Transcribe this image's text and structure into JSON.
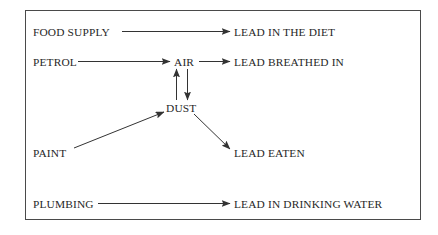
{
  "figure": {
    "type": "flow-diagram",
    "frame": {
      "stroke": "#4a4a4a",
      "fill": "#ffffff"
    },
    "text_color": "#272727",
    "line_color": "#333333"
  },
  "nodes": {
    "food_supply": "FOOD SUPPLY",
    "lead_in_the_diet": "LEAD IN THE DIET",
    "petrol": "PETROL",
    "air": "AIR",
    "lead_breathed_in": "LEAD BREATHED IN",
    "dust": "DUST",
    "paint": "PAINT",
    "lead_eaten": "LEAD EATEN",
    "plumbing": "PLUMBING",
    "lead_in_drinking_water": "LEAD IN DRINKING WATER"
  },
  "edges": [
    {
      "id": "food-to-diet",
      "from": "FOOD SUPPLY",
      "to": "LEAD IN THE DIET",
      "direction": "right"
    },
    {
      "id": "petrol-to-air",
      "from": "PETROL",
      "to": "AIR",
      "direction": "right"
    },
    {
      "id": "air-to-breathed",
      "from": "AIR",
      "to": "LEAD BREATHED IN",
      "direction": "right"
    },
    {
      "id": "dust-to-air",
      "from": "DUST",
      "to": "AIR",
      "direction": "up"
    },
    {
      "id": "air-to-dust",
      "from": "AIR",
      "to": "DUST",
      "direction": "down"
    },
    {
      "id": "paint-to-dust",
      "from": "PAINT",
      "to": "DUST",
      "direction": "up-right"
    },
    {
      "id": "dust-to-eaten",
      "from": "DUST",
      "to": "LEAD EATEN",
      "direction": "down-right"
    },
    {
      "id": "plumbing-to-water",
      "from": "PLUMBING",
      "to": "LEAD IN DRINKING WATER",
      "direction": "right"
    }
  ]
}
